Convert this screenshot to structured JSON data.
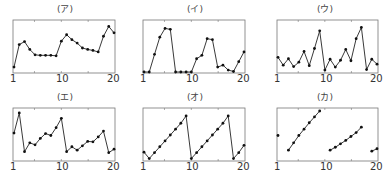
{
  "chart_data": [
    {
      "type": "line",
      "title": "(ア)",
      "x": [
        1,
        2,
        3,
        4,
        5,
        6,
        7,
        8,
        9,
        10,
        11,
        12,
        13,
        14,
        15,
        16,
        17,
        18,
        19,
        20
      ],
      "values": [
        1.0,
        5.6,
        6.2,
        4.6,
        3.5,
        3.4,
        3.4,
        3.4,
        3.3,
        6.3,
        7.6,
        6.6,
        5.9,
        4.9,
        4.6,
        4.4,
        4.1,
        7.3,
        9.3,
        8.0
      ],
      "xlabel": "",
      "ylabel": "",
      "xticks": [
        1,
        10,
        20
      ],
      "xlim": [
        1,
        20
      ],
      "ylim": [
        0,
        10
      ],
      "grid": false
    },
    {
      "type": "line",
      "title": "(イ)",
      "x": [
        1,
        2,
        3,
        4,
        5,
        6,
        7,
        8,
        9,
        10,
        11,
        12,
        13,
        14,
        15,
        16,
        17,
        18,
        19,
        20
      ],
      "values": [
        0.0,
        0.0,
        3.6,
        7.1,
        8.9,
        8.7,
        0.0,
        0.0,
        0.0,
        0.0,
        2.7,
        3.4,
        6.8,
        6.6,
        1.0,
        1.4,
        0.4,
        0.1,
        2.1,
        4.1
      ],
      "xlabel": "",
      "ylabel": "",
      "xticks": [
        1,
        10,
        20
      ],
      "xlim": [
        1,
        20
      ],
      "ylim": [
        0,
        10
      ],
      "grid": false
    },
    {
      "type": "line",
      "title": "(ウ)",
      "x": [
        1,
        2,
        3,
        4,
        5,
        6,
        7,
        8,
        9,
        10,
        11,
        12,
        13,
        14,
        15,
        16,
        17,
        18,
        19,
        20
      ],
      "values": [
        3.0,
        1.4,
        2.7,
        1.1,
        2.0,
        4.2,
        1.3,
        4.8,
        8.4,
        0.4,
        2.6,
        1.0,
        2.4,
        4.6,
        2.3,
        6.8,
        9.1,
        0.5,
        2.6,
        1.6
      ],
      "xlabel": "",
      "ylabel": "",
      "xticks": [
        1,
        10,
        20
      ],
      "xlim": [
        1,
        20
      ],
      "ylim": [
        0,
        10
      ],
      "grid": false
    },
    {
      "type": "line",
      "title": "(エ)",
      "x": [
        1,
        2,
        3,
        4,
        5,
        6,
        7,
        8,
        9,
        10,
        11,
        12,
        13,
        14,
        15,
        16,
        17,
        18,
        19,
        20
      ],
      "values": [
        5.5,
        9.6,
        1.7,
        3.5,
        3.1,
        4.4,
        5.4,
        5.0,
        6.6,
        8.5,
        1.7,
        2.7,
        2.0,
        2.9,
        3.8,
        3.7,
        4.7,
        5.9,
        1.5,
        2.2
      ],
      "xlabel": "",
      "ylabel": "",
      "xticks": [
        1,
        10,
        20
      ],
      "xlim": [
        1,
        20
      ],
      "ylim": [
        0,
        10
      ],
      "grid": false
    },
    {
      "type": "line",
      "title": "(オ)",
      "x": [
        1,
        2,
        3,
        4,
        5,
        6,
        7,
        8,
        9,
        10,
        11,
        12,
        13,
        14,
        15,
        16,
        17,
        18,
        19,
        20
      ],
      "values": [
        1.6,
        0.3,
        1.5,
        2.7,
        3.9,
        5.1,
        6.3,
        7.5,
        9.0,
        0.3,
        1.5,
        2.7,
        3.9,
        5.1,
        6.3,
        7.5,
        9.0,
        0.3,
        1.5,
        3.0
      ],
      "xlabel": "",
      "ylabel": "",
      "xticks": [
        1,
        10,
        20
      ],
      "xlim": [
        1,
        20
      ],
      "ylim": [
        0,
        10
      ],
      "grid": false
    },
    {
      "type": "scatter",
      "title": "(カ)",
      "x": [
        1,
        3,
        4,
        5,
        6,
        7,
        8,
        9,
        11,
        12,
        13,
        14,
        15,
        16,
        17,
        19,
        20
      ],
      "values": [
        5.0,
        2.0,
        3.5,
        5.0,
        6.3,
        7.6,
        8.8,
        10.0,
        2.0,
        2.6,
        3.3,
        4.0,
        4.8,
        5.6,
        6.7,
        1.8,
        2.3
      ],
      "xlabel": "",
      "ylabel": "",
      "xticks": [
        1,
        10,
        20
      ],
      "xlim": [
        1,
        20
      ],
      "ylim": [
        0,
        10
      ],
      "grid": false
    }
  ],
  "panels": [
    {
      "title": "(ア)",
      "tick1": "1",
      "tick10": "10",
      "tick20": "20"
    },
    {
      "title": "(イ)",
      "tick1": "1",
      "tick10": "10",
      "tick20": "20"
    },
    {
      "title": "(ウ)",
      "tick1": "1",
      "tick10": "10",
      "tick20": "20"
    },
    {
      "title": "(エ)",
      "tick1": "1",
      "tick10": "10",
      "tick20": "20"
    },
    {
      "title": "(オ)",
      "tick1": "1",
      "tick10": "10",
      "tick20": "20"
    },
    {
      "title": "(カ)",
      "tick1": "1",
      "tick10": "10",
      "tick20": "20"
    }
  ],
  "style": {
    "line_color": "#222222",
    "marker_color": "#111111",
    "frame_color": "#777777"
  }
}
